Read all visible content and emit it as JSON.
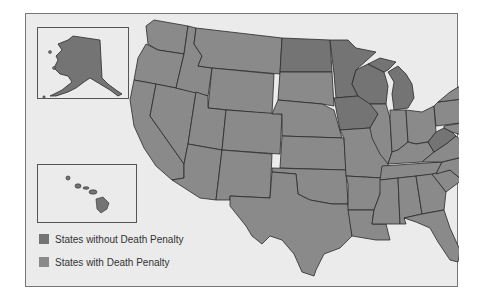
{
  "map": {
    "title": "",
    "colors": {
      "no_death_penalty": "#747474",
      "death_penalty": "#8a8a8a",
      "border": "#2a2a2a",
      "background": "#ebebeb"
    },
    "states_without_death_penalty": [
      "Alaska",
      "Hawaii",
      "North Dakota",
      "Minnesota",
      "Iowa",
      "Wisconsin",
      "Michigan",
      "West Virginia",
      "Vermont",
      "Massachusetts",
      "Rhode Island",
      "Maine"
    ],
    "insets": [
      "Alaska",
      "Hawaii"
    ]
  },
  "legend": {
    "items": [
      {
        "label": "States without Death Penalty",
        "color": "#747474"
      },
      {
        "label": "States with Death Penalty",
        "color": "#8a8a8a"
      }
    ]
  }
}
